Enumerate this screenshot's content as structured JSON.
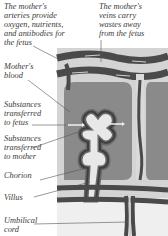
{
  "labels": {
    "arteries": "The mother's\narteries provide\noxygen, nutrients,\nand antibodies for\nthe fetus",
    "veins": "The mother's\nveins carry\nwastes away\nfrom the fetus",
    "mothers_blood": "Mother's\nblood",
    "to_fetus": "Substances\ntransferred\nto fetus",
    "to_mother": "Substances\ntransferred\nto mother",
    "chorion": "Chorion",
    "villus": "Villus",
    "umbilical_cord": "Umbilical\ncord"
  },
  "colors": {
    "vessel_dark": "#4a4a4a",
    "vessel_mid": "#7a7a7a",
    "blood_pool": "#8c8c8c",
    "light_tissue": "#d9d9d9",
    "pale": "#ececec",
    "text": "#3a3a3a",
    "leader_line": "#555555"
  }
}
